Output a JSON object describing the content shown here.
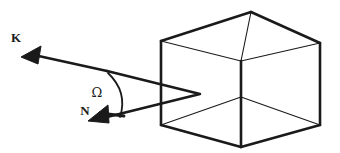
{
  "figure": {
    "background_color": "#ffffff",
    "stroke_color": "#1a1a1a",
    "labels": {
      "k_vector": "K",
      "n_vector": "N",
      "angle": "Ω"
    },
    "elements": {
      "cube_name": "cube-wireframe",
      "k_arrow_name": "k-vector-arrow",
      "n_arrow_name": "n-vector-arrow",
      "angle_arc_name": "omega-angle-arc",
      "ray_path_name": "ray-path-into-cube"
    },
    "geometry": {
      "cube": {
        "front_top_left": [
          161,
          41
        ],
        "front_top_right": [
          241,
          61
        ],
        "front_bottom_left": [
          161,
          125
        ],
        "front_bottom_right": [
          241,
          147
        ],
        "back_top_left": [
          251,
          12
        ],
        "back_top_right": [
          320,
          43
        ],
        "back_bottom_right": [
          320,
          125
        ],
        "inner_bottom": [
          241,
          97
        ]
      },
      "vertex": [
        107,
        71
      ],
      "k_tip": [
        21,
        57
      ],
      "n_tip": [
        88,
        121
      ],
      "ray_fold_point": [
        200,
        94
      ],
      "arc_start": [
        108,
        73
      ],
      "arc_end": [
        122,
        117
      ]
    }
  }
}
